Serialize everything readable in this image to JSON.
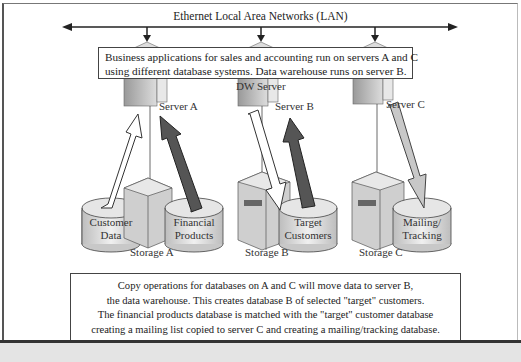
{
  "network": {
    "title": "Ethernet Local Area Networks (LAN)"
  },
  "top_note": {
    "lines": [
      "Business applications for sales and accounting run on servers A and C",
      "using different database systems.  Data warehouse runs on server B."
    ]
  },
  "servers": [
    {
      "label": "Server A"
    },
    {
      "label": "Server B",
      "sublabel": "DW Server"
    },
    {
      "label": "Server C"
    }
  ],
  "storage": [
    {
      "label": "Storage A",
      "databases": [
        {
          "line1": "Customer",
          "line2": "Data"
        },
        {
          "line1": "Financial",
          "line2": "Products"
        }
      ]
    },
    {
      "label": "Storage B",
      "databases": [
        {
          "line1": "Target",
          "line2": "Customers"
        }
      ]
    },
    {
      "label": "Storage C",
      "databases": [
        {
          "line1": "Mailing/",
          "line2": "Tracking"
        }
      ]
    }
  ],
  "arrows": [
    {
      "from": "Customer Data",
      "to": "Server A",
      "style": "white"
    },
    {
      "from": "Financial Products",
      "to": "Server A",
      "style": "dark"
    },
    {
      "from": "Server B",
      "to": "Target Customers",
      "style": "white"
    },
    {
      "from": "Target Customers",
      "to": "Server B",
      "style": "dark"
    },
    {
      "from": "Server C",
      "to": "Mailing/Tracking",
      "style": "gray"
    }
  ],
  "bottom_note": {
    "lines": [
      "Copy operations for databases on A and C will move data to server B,",
      "the data warehouse.  This creates database B of selected \"target\" customers.",
      "The financial products database is matched with the \"target\" customer database",
      "creating a mailing list copied to server C and creating a mailing/tracking database."
    ]
  },
  "colors": {
    "dark_arrow": "#555555",
    "gray_arrow": "#c8c8c8",
    "white_arrow": "#ffffff",
    "outline": "#333333"
  }
}
